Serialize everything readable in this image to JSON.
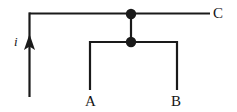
{
  "figure": {
    "background_color": "#ffffff",
    "stroke_color": "#1a1a1a",
    "label_color": "#151515",
    "width": 237,
    "height": 112
  },
  "labels": {
    "current": "i",
    "terminal_a": "A",
    "terminal_b": "B",
    "terminal_c": "C"
  },
  "geometry": {
    "source_wire_x": 29.5,
    "source_wire_top_y": 13.5,
    "source_wire_bottom_y": 97,
    "top_wire_y": 13.5,
    "top_wire_right_x": 210,
    "junction_top": {
      "x": 131,
      "y": 14,
      "r": 5.2
    },
    "junction_mid": {
      "x": 131,
      "y": 42,
      "r": 5.2
    },
    "bracket_bar_y": 42,
    "bracket_left_x": 90,
    "bracket_right_x": 177,
    "branch_bottom_y": 90,
    "arrow_tip_y": 34,
    "arrow_base_y": 50,
    "arrow_half_width": 5.5,
    "stroke_width": 2.2
  },
  "annotations": {
    "current_label_pos": {
      "x": 14,
      "y": 35
    },
    "label_a_pos": {
      "x": 85,
      "y": 94
    },
    "label_b_pos": {
      "x": 171,
      "y": 94
    },
    "label_c_pos": {
      "x": 213,
      "y": 6
    }
  }
}
